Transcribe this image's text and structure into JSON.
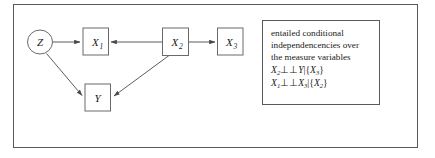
{
  "diagram": {
    "type": "causal-dag",
    "nodes": [
      {
        "id": "Z",
        "label": "Z",
        "sub": "",
        "shape": "ellipse",
        "x": 40,
        "y": 42
      },
      {
        "id": "X1",
        "label": "X",
        "sub": "1",
        "shape": "box",
        "x": 95,
        "y": 41
      },
      {
        "id": "X2",
        "label": "X",
        "sub": "2",
        "shape": "box",
        "x": 175,
        "y": 41
      },
      {
        "id": "X3",
        "label": "X",
        "sub": "3",
        "shape": "box",
        "x": 230,
        "y": 41
      },
      {
        "id": "Y",
        "label": "Y",
        "sub": "",
        "shape": "box",
        "x": 97,
        "y": 97
      }
    ],
    "edges": [
      {
        "from": "Z",
        "to": "X1"
      },
      {
        "from": "Z",
        "to": "Y"
      },
      {
        "from": "X2",
        "to": "X1"
      },
      {
        "from": "X2",
        "to": "X3"
      },
      {
        "from": "X2",
        "to": "Y"
      }
    ]
  },
  "annotation": {
    "line1": "entailed conditional",
    "line2": "independencencies over",
    "line3": "the measure variables",
    "statement1": {
      "left": "X",
      "left_sub": "2",
      "relation": "⊥⊥",
      "right": "Y",
      "right_sub": "",
      "bar": "|",
      "cond_open": "{",
      "cond": "X",
      "cond_sub": "3",
      "cond_close": "}"
    },
    "statement2": {
      "left": "X",
      "left_sub": "1",
      "relation": "⊥⊥",
      "right": "X",
      "right_sub": "3",
      "bar": "|",
      "cond_open": "{",
      "cond": "X",
      "cond_sub": "2",
      "cond_close": "}"
    }
  },
  "colors": {
    "frame_stroke": "#5a5a5a",
    "node_stroke": "#6a6a6a",
    "edge_stroke": "#4a4a4a",
    "text": "#1a1a1a",
    "background": "#ffffff"
  }
}
